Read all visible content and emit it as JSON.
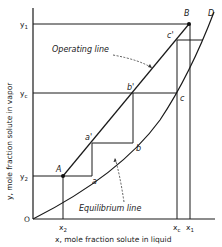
{
  "diagram": {
    "x_axis_label": "x, mole fraction solute in liquid",
    "y_axis_label": "y, mole fraction solute in vapor",
    "origin_label": "O",
    "x_ticks": [
      "x2",
      "xc",
      "x1"
    ],
    "y_ticks": [
      "y1",
      "yc",
      "y2"
    ],
    "x_tick_display": {
      "x2": "x",
      "x2_sub": "2",
      "xc": "x",
      "xc_sub": "c",
      "x1": "x",
      "x1_sub": "1"
    },
    "y_tick_display": {
      "y1": "y",
      "y1_sub": "1",
      "yc": "y",
      "yc_sub": "c",
      "y2": "y",
      "y2_sub": "2"
    },
    "curves": {
      "operating_line": "Operating line",
      "equilibrium_line": "Equilibrium line"
    },
    "points": {
      "A": "A",
      "B": "B",
      "D": "D",
      "a": "a",
      "a_prime": "a'",
      "b": "b",
      "b_prime": "b'",
      "c": "c",
      "c_prime": "c'"
    }
  }
}
